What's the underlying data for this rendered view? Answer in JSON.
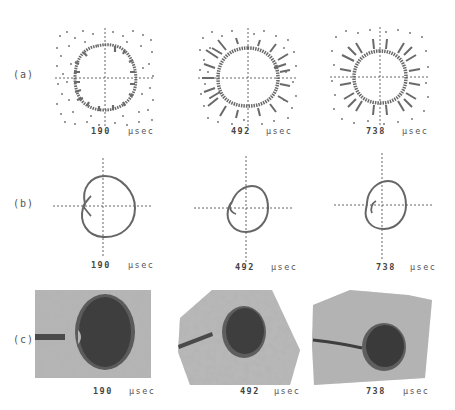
{
  "figure": {
    "rows": [
      {
        "label": "(a)",
        "description": "particle scatter plots"
      },
      {
        "label": "(b)",
        "description": "computed bubble outline"
      },
      {
        "label": "(c)",
        "description": "photographs"
      }
    ],
    "panels": [
      {
        "row": "a",
        "time": "190",
        "unit": "µsec"
      },
      {
        "row": "a",
        "time": "492",
        "unit": "µsec"
      },
      {
        "row": "a",
        "time": "738",
        "unit": "µsec"
      },
      {
        "row": "b",
        "time": "190",
        "unit": "µsec"
      },
      {
        "row": "b",
        "time": "492",
        "unit": "µsec"
      },
      {
        "row": "b",
        "time": "738",
        "unit": "µsec"
      },
      {
        "row": "c",
        "time": "190",
        "unit": "µsec"
      },
      {
        "row": "c",
        "time": "492",
        "unit": "µsec"
      },
      {
        "row": "c",
        "time": "738",
        "unit": "µsec"
      }
    ],
    "colors": {
      "ink": "#5a5a5a",
      "dots": "#6a6a6a",
      "photo_bg": "#b8b8b8",
      "photo_dark": "#3a3a3a"
    }
  }
}
